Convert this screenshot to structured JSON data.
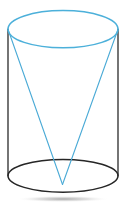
{
  "figure": {
    "title": "Cone inscribed in a cylinder",
    "canvas": {
      "width": 128,
      "height": 209,
      "background": "#ffffff"
    },
    "colors": {
      "cone": "#4aaad6",
      "cone_top_rim": "#4cb0da",
      "cylinder_edge": "#3a3a3a",
      "cylinder_base": "#262626",
      "shadow": "#b9b9b9",
      "background": "#ffffff"
    },
    "strokes": {
      "cone_width": 1.1,
      "cone_rim_width": 1.5,
      "cylinder_side_width": 1.4,
      "cylinder_base_width": 1.5
    },
    "shapes": {
      "top_ellipse": {
        "name": "cylinder-top-rim",
        "cx": 63,
        "cy": 29.2,
        "rx": 55,
        "ry": 18.6,
        "stroke": "#4cb0da",
        "fill": "none"
      },
      "bottom_ellipse": {
        "name": "cylinder-base-rim",
        "cx": 63,
        "cy": 175.8,
        "rx": 55,
        "ry": 16.4,
        "stroke": "#262626",
        "fill": "none"
      },
      "left_side": {
        "name": "cylinder-left-side",
        "x1": 8,
        "y1": 29.2,
        "x2": 8,
        "y2": 175.8,
        "stroke": "#3a3a3a"
      },
      "right_side": {
        "name": "cylinder-right-side",
        "x1": 118,
        "y1": 29.2,
        "x2": 118,
        "y2": 175.8,
        "stroke": "#3a3a3a"
      },
      "cone_apex": {
        "x": 62.5,
        "y": 184.5
      },
      "cone_left_slant": {
        "name": "cone-left-slant",
        "x1": 8,
        "y1": 29.2,
        "x2": 62.5,
        "y2": 184.5,
        "stroke": "#4aaad6"
      },
      "cone_right_slant": {
        "name": "cone-right-slant",
        "x1": 118,
        "y1": 29.2,
        "x2": 62.5,
        "y2": 184.5,
        "stroke": "#4aaad6"
      },
      "shadow": {
        "name": "ground-shadow",
        "cx": 63,
        "cy": 199,
        "rx": 46,
        "ry": 3.2,
        "fill": "#c9c9c9"
      }
    },
    "labels": []
  }
}
